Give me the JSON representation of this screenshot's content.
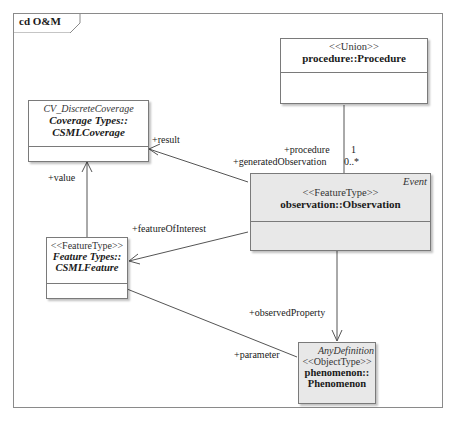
{
  "frame": {
    "label": "cd O&M"
  },
  "classes": {
    "procedure": {
      "stereotype": "<<Union>>",
      "name": "procedure::Procedure"
    },
    "coverage": {
      "tag": "CV_DiscreteCoverage",
      "name_line1": "Coverage Types::",
      "name_line2": "CSMLCoverage"
    },
    "observation": {
      "tag": "Event",
      "stereotype": "<<FeatureType>>",
      "name": "observation::Observation"
    },
    "feature": {
      "stereotype": "<<FeatureType>>",
      "name_line1": "Feature Types::",
      "name_line2": "CSMLFeature"
    },
    "phenomenon": {
      "tag": "AnyDefinition",
      "stereotype": "<<ObjectType>>",
      "name_line1": "phenomenon::",
      "name_line2": "Phenomenon"
    }
  },
  "associations": {
    "procedure_role": "+procedure",
    "procedure_mult": "1",
    "generated_role": "+generatedObservation",
    "generated_mult": "0..*",
    "result_role": "+result",
    "value_role": "+value",
    "foi_role": "+featureOfInterest",
    "observed_role": "+observedProperty",
    "parameter_role": "+parameter"
  }
}
